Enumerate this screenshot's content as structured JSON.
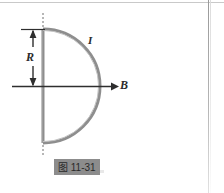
{
  "figure": {
    "kind": "physics-diagram",
    "caption": "图 11-31",
    "labels": {
      "radius": "R",
      "current": "I",
      "field": "B"
    },
    "colors": {
      "wire": "#8a8a8a",
      "wire_highlight": "#b6b6b6",
      "axis": "#2e2e2e",
      "caption_highlight": "#8c8c8c",
      "page_border": "#b5b5b5",
      "background": "#ffffff"
    },
    "geometry": {
      "diameter_x": 43,
      "center_y": 86,
      "radius_px": 57,
      "top_y": 29,
      "bottom_y": 143,
      "arc_right_x": 101,
      "field_arrow_start_x": 12,
      "field_arrow_end_x": 119,
      "dimension_arrow_x": 33
    }
  }
}
